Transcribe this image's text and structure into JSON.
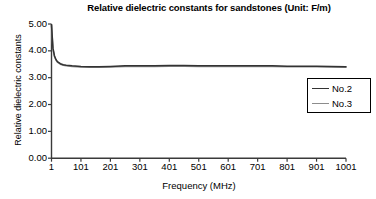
{
  "chart_data": {
    "type": "line",
    "title": "Relative dielectric constants for sandstones (Unit: F/m)",
    "xlabel": "Frequency (MHz)",
    "ylabel": "Relative dielectric constants",
    "xlim": [
      1,
      1001
    ],
    "ylim": [
      0.0,
      5.0
    ],
    "grid": false,
    "legend_position": "right",
    "xticks": [
      "1",
      "101",
      "201",
      "301",
      "401",
      "501",
      "601",
      "701",
      "801",
      "901",
      "1001"
    ],
    "xtick_values": [
      1,
      101,
      201,
      301,
      401,
      501,
      601,
      701,
      801,
      901,
      1001
    ],
    "yticks": [
      "0.00",
      "1.00",
      "2.00",
      "3.00",
      "4.00",
      "5.00"
    ],
    "ytick_values": [
      0.0,
      1.0,
      2.0,
      3.0,
      4.0,
      5.0
    ],
    "x": [
      1,
      6,
      11,
      16,
      21,
      31,
      41,
      51,
      71,
      101,
      131,
      161,
      201,
      251,
      301,
      351,
      401,
      451,
      501,
      551,
      601,
      651,
      701,
      751,
      801,
      851,
      901,
      951,
      1001
    ],
    "series": [
      {
        "name": "No.2",
        "color": "#333333",
        "values": [
          4.97,
          4.1,
          3.82,
          3.68,
          3.6,
          3.52,
          3.48,
          3.46,
          3.44,
          3.42,
          3.41,
          3.41,
          3.42,
          3.44,
          3.44,
          3.44,
          3.45,
          3.45,
          3.44,
          3.44,
          3.44,
          3.44,
          3.44,
          3.44,
          3.43,
          3.43,
          3.43,
          3.42,
          3.41
        ]
      },
      {
        "name": "No.3",
        "color": "#8c8c8c",
        "values": [
          4.95,
          4.06,
          3.79,
          3.66,
          3.58,
          3.5,
          3.46,
          3.44,
          3.42,
          3.4,
          3.39,
          3.39,
          3.4,
          3.42,
          3.42,
          3.42,
          3.43,
          3.43,
          3.42,
          3.42,
          3.42,
          3.42,
          3.42,
          3.42,
          3.41,
          3.41,
          3.41,
          3.4,
          3.39
        ]
      }
    ]
  },
  "legend": {
    "items": [
      {
        "label": "No.2",
        "color": "#333333"
      },
      {
        "label": "No.3",
        "color": "#8c8c8c"
      }
    ]
  },
  "axes": {
    "axis_color": "#3a3a3a"
  }
}
